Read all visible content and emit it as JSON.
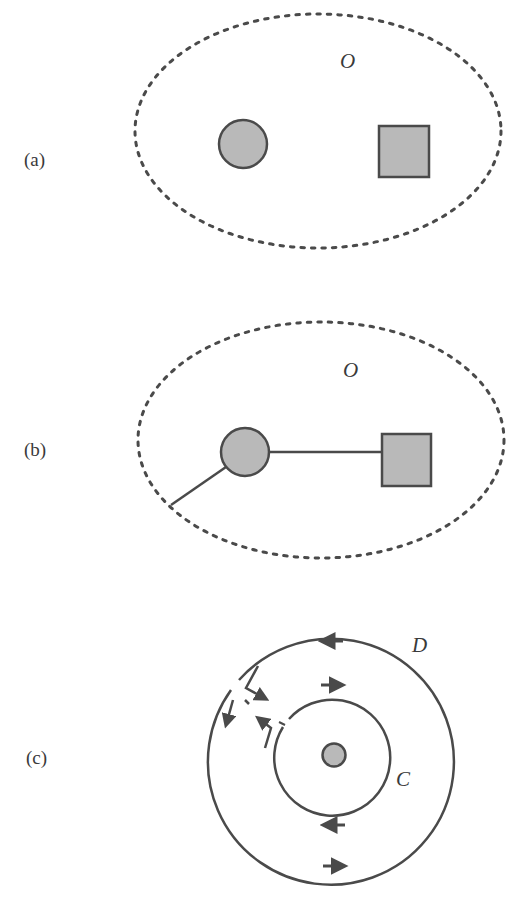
{
  "colors": {
    "background": "#ffffff",
    "stroke": "#4a4a4a",
    "fill_gray": "#b9b9b9",
    "text": "#3a3a3a"
  },
  "panels": [
    {
      "id": "a",
      "label": "(a)",
      "region_label": "O",
      "elements": [
        "dotted-ellipse-region",
        "gray-circle",
        "gray-square"
      ]
    },
    {
      "id": "b",
      "label": "(b)",
      "region_label": "O",
      "elements": [
        "dotted-ellipse-region",
        "gray-circle",
        "gray-square",
        "connecting-line",
        "outgoing-line"
      ]
    },
    {
      "id": "c",
      "label": "(c)",
      "outer_circle_label": "D",
      "inner_circle_label": "C",
      "elements": [
        "outer-circle",
        "inner-circle",
        "center-dot",
        "direction-arrows",
        "cut-path-arrows"
      ]
    }
  ]
}
